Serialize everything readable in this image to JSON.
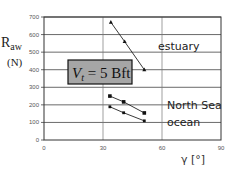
{
  "chart_data": {
    "type": "line",
    "title": "",
    "xlabel": "γ [°]",
    "ylabel_main": "R",
    "ylabel_sub": "aw",
    "ylabel_unit": "(N)",
    "xlim": [
      0,
      90
    ],
    "ylim": [
      0,
      700
    ],
    "xticks": [
      0,
      30,
      60,
      90
    ],
    "yticks": [
      0,
      100,
      200,
      300,
      400,
      500,
      600,
      700
    ],
    "xtick_labels": [
      "0",
      "30",
      "60",
      "90"
    ],
    "ytick_labels": [
      "0",
      "100",
      "200",
      "300",
      "400",
      "500",
      "600",
      "700"
    ],
    "grid": true,
    "annotation": {
      "main": "V",
      "sub": "t",
      "rest": " = 5 Bft"
    },
    "series": [
      {
        "name": "estuary",
        "marker": "triangle",
        "x": [
          34,
          41,
          51
        ],
        "y": [
          670,
          560,
          400
        ]
      },
      {
        "name": "North Sea",
        "marker": "square",
        "x": [
          33.5,
          40.5,
          51
        ],
        "y": [
          250,
          217,
          154
        ]
      },
      {
        "name": "ocean",
        "marker": "diamond",
        "x": [
          33.5,
          40.5,
          51
        ],
        "y": [
          189,
          155,
          109
        ]
      }
    ]
  }
}
